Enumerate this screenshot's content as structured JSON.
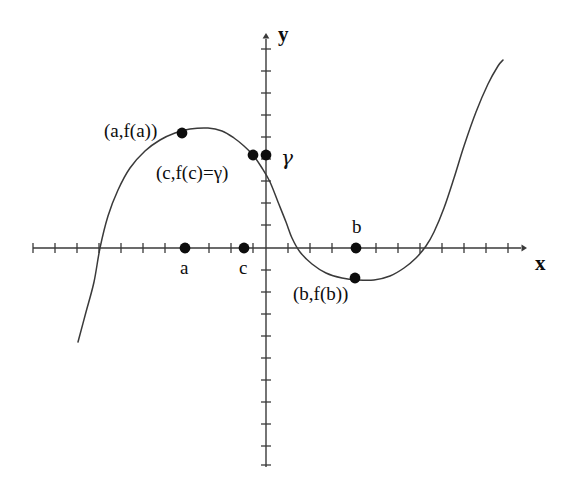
{
  "figure": {
    "title": "",
    "background_color": "#ffffff",
    "stroke_color": "#3a3a3a",
    "text_color": "#0d0d0d",
    "width": 571,
    "height": 485
  },
  "axes": {
    "x_axis_label": "x",
    "y_axis_label": "y",
    "origin": {
      "x": 266,
      "y": 248
    },
    "x_axis_start": 33,
    "x_axis_end": 527,
    "y_axis_top": 33,
    "y_axis_bottom": 467,
    "tick_spacing": 22,
    "grid": false
  },
  "labels": {
    "a_f_a": "(a,f(a))",
    "c_f_c_gamma": "(c,f(c)=γ)",
    "gamma": "γ",
    "b_f_b": "(b,f(b))",
    "a": "a",
    "b": "b",
    "c": "c"
  },
  "chart_data": {
    "type": "line",
    "title": "",
    "xlabel": "x",
    "ylabel": "y",
    "grid": false,
    "legend": null,
    "curve": {
      "name": "f(x)",
      "points_px": [
        [
          78,
          342
        ],
        [
          86,
          312
        ],
        [
          94,
          282
        ],
        [
          100,
          248
        ],
        [
          108,
          216
        ],
        [
          118,
          190
        ],
        [
          130,
          168
        ],
        [
          145,
          151
        ],
        [
          160,
          140
        ],
        [
          175,
          133
        ],
        [
          190,
          129
        ],
        [
          208,
          128
        ],
        [
          222,
          131
        ],
        [
          234,
          138
        ],
        [
          244,
          146
        ],
        [
          253,
          155
        ],
        [
          262,
          168
        ],
        [
          270,
          182
        ],
        [
          278,
          202
        ],
        [
          286,
          222
        ],
        [
          292,
          238
        ],
        [
          300,
          252
        ],
        [
          312,
          264
        ],
        [
          326,
          273
        ],
        [
          342,
          278
        ],
        [
          358,
          280
        ],
        [
          374,
          280
        ],
        [
          390,
          276
        ],
        [
          404,
          268
        ],
        [
          416,
          258
        ],
        [
          426,
          246
        ],
        [
          434,
          232
        ],
        [
          444,
          208
        ],
        [
          454,
          178
        ],
        [
          464,
          146
        ],
        [
          476,
          112
        ],
        [
          488,
          84
        ],
        [
          498,
          66
        ],
        [
          503,
          60
        ]
      ]
    },
    "marked_points": [
      {
        "name": "(a,f(a))",
        "px": [
          182,
          133
        ],
        "on": "curve",
        "label": "(a,f(a))",
        "label_px": [
          104,
          121
        ]
      },
      {
        "name": "(c,f(c)=gamma)",
        "px": [
          253,
          155
        ],
        "on": "curve",
        "label": "(c,f(c)=γ)",
        "label_px": [
          156,
          163
        ]
      },
      {
        "name": "gamma",
        "px": [
          266,
          155
        ],
        "on": "y-axis",
        "label": "γ",
        "label_px": [
          281,
          148
        ]
      },
      {
        "name": "(b,f(b))",
        "px": [
          355,
          278
        ],
        "on": "curve",
        "label": "(b,f(b))",
        "label_px": [
          293,
          284
        ]
      },
      {
        "name": "a",
        "px": [
          185,
          248
        ],
        "on": "x-axis",
        "label": "a",
        "label_px": [
          180,
          258
        ]
      },
      {
        "name": "c",
        "px": [
          244,
          248
        ],
        "on": "x-axis",
        "label": "c",
        "label_px": [
          239,
          258
        ]
      },
      {
        "name": "b",
        "px": [
          356,
          248
        ],
        "on": "x-axis",
        "label": "b",
        "label_px": [
          352,
          217
        ]
      }
    ],
    "x_ticks_px": [
      33,
      55,
      77,
      99,
      121,
      143,
      165,
      187,
      209,
      231,
      253,
      288,
      310,
      332,
      354,
      376,
      398,
      420,
      442,
      464,
      486,
      508
    ],
    "y_ticks_px": [
      49,
      71,
      93,
      115,
      137,
      159,
      181,
      203,
      225,
      270,
      292,
      314,
      336,
      358,
      380,
      402,
      424,
      446,
      465
    ]
  }
}
